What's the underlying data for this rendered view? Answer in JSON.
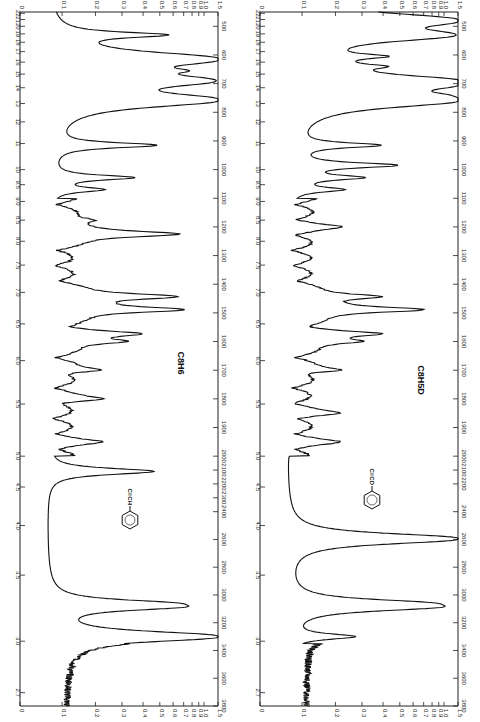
{
  "page": {
    "background": "#ffffff",
    "ink": "#111111"
  },
  "chart_data": [
    {
      "type": "line",
      "title": "C8H6",
      "structure_label": "C≡CH",
      "orientation": "rotated-90 (wavenumber vertical, absorbance horizontal)",
      "xlabel": "Wavenumber (cm-1)",
      "ylabel": "Absorbance",
      "wavenumber_range": [
        450,
        3800
      ],
      "absorbance_range": [
        0,
        1.5
      ],
      "wavenumber_ticks": [
        500,
        600,
        700,
        800,
        900,
        1000,
        1100,
        1200,
        1300,
        1400,
        1500,
        1600,
        1700,
        1800,
        1900,
        2000,
        2100,
        2200,
        2300,
        2400,
        2600,
        2800,
        3000,
        3200,
        3400,
        3600,
        3800
      ],
      "absorbance_ticks": [
        "0",
        "0.1",
        "0.2",
        "0.3",
        "0.4",
        "0.5",
        "0.6",
        "0.7",
        "0.8",
        "0.9",
        "1.0",
        "1.5"
      ],
      "micron_ticks": [
        "2.7",
        "3.0",
        "3.5",
        "4.0",
        "4.5",
        "5.0",
        "5.5",
        "6.0",
        "6.5",
        "7.0",
        "7.5",
        "8.0",
        "8.5",
        "9.0",
        "9.5",
        "10",
        "11",
        "12",
        "13",
        "14",
        "15",
        "16",
        "17",
        "18",
        "19",
        "20",
        "21",
        "22"
      ],
      "peaks": [
        {
          "wavenumber": 530,
          "absorbance": 0.45
        },
        {
          "wavenumber": 615,
          "absorbance": 1.5
        },
        {
          "wavenumber": 655,
          "absorbance": 0.35
        },
        {
          "wavenumber": 690,
          "absorbance": 1.2
        },
        {
          "wavenumber": 757,
          "absorbance": 1.5
        },
        {
          "wavenumber": 915,
          "absorbance": 0.4
        },
        {
          "wavenumber": 1028,
          "absorbance": 0.28
        },
        {
          "wavenumber": 1070,
          "absorbance": 0.15
        },
        {
          "wavenumber": 1176,
          "absorbance": 0.1
        },
        {
          "wavenumber": 1225,
          "absorbance": 0.58
        },
        {
          "wavenumber": 1443,
          "absorbance": 0.55
        },
        {
          "wavenumber": 1489,
          "absorbance": 0.6
        },
        {
          "wavenumber": 1573,
          "absorbance": 0.25
        },
        {
          "wavenumber": 1600,
          "absorbance": 0.22
        },
        {
          "wavenumber": 1700,
          "absorbance": 0.12
        },
        {
          "wavenumber": 1800,
          "absorbance": 0.12
        },
        {
          "wavenumber": 1950,
          "absorbance": 0.1
        },
        {
          "wavenumber": 2110,
          "absorbance": 0.4
        },
        {
          "wavenumber": 3060,
          "absorbance": 0.38
        },
        {
          "wavenumber": 3085,
          "absorbance": 0.5
        },
        {
          "wavenumber": 3300,
          "absorbance": 1.5
        }
      ]
    },
    {
      "type": "line",
      "title": "C8H5D",
      "structure_label": "C≡CD",
      "orientation": "rotated-90 (wavenumber vertical, absorbance horizontal)",
      "xlabel": "Wavenumber (cm-1)",
      "ylabel": "Absorbance",
      "wavenumber_range": [
        450,
        3800
      ],
      "absorbance_range": [
        0,
        1.5
      ],
      "wavenumber_ticks": [
        500,
        600,
        700,
        800,
        900,
        1000,
        1100,
        1200,
        1300,
        1400,
        1500,
        1600,
        1700,
        1800,
        1900,
        2000,
        2100,
        2200,
        2400,
        2600,
        2800,
        3000,
        3200,
        3400,
        3600,
        3800
      ],
      "absorbance_ticks": [
        "0",
        "0.1",
        "0.2",
        "0.3",
        "0.4",
        "0.5",
        "0.6",
        "0.7",
        "0.8",
        "0.9",
        "1.0",
        "1.5"
      ],
      "micron_ticks": [
        "2.7",
        "3.0",
        "3.5",
        "4.0",
        "4.5",
        "5.0",
        "5.5",
        "6.0",
        "6.5",
        "7.0",
        "7.5",
        "8.0",
        "8.5",
        "9.0",
        "9.5",
        "10",
        "11",
        "12",
        "13",
        "14",
        "15",
        "16",
        "17",
        "18",
        "19",
        "20",
        "21",
        "22"
      ],
      "peaks": [
        {
          "wavenumber": 480,
          "absorbance": 1.5
        },
        {
          "wavenumber": 530,
          "absorbance": 1.2
        },
        {
          "wavenumber": 605,
          "absorbance": 0.25
        },
        {
          "wavenumber": 640,
          "absorbance": 0.2
        },
        {
          "wavenumber": 690,
          "absorbance": 0.7
        },
        {
          "wavenumber": 700,
          "absorbance": 1.5
        },
        {
          "wavenumber": 757,
          "absorbance": 1.5
        },
        {
          "wavenumber": 740,
          "absorbance": 0.3
        },
        {
          "wavenumber": 915,
          "absorbance": 0.3
        },
        {
          "wavenumber": 985,
          "absorbance": 0.4
        },
        {
          "wavenumber": 1028,
          "absorbance": 0.22
        },
        {
          "wavenumber": 1070,
          "absorbance": 0.15
        },
        {
          "wavenumber": 1200,
          "absorbance": 0.1
        },
        {
          "wavenumber": 1443,
          "absorbance": 0.3
        },
        {
          "wavenumber": 1489,
          "absorbance": 0.6
        },
        {
          "wavenumber": 1573,
          "absorbance": 0.25
        },
        {
          "wavenumber": 1600,
          "absorbance": 0.2
        },
        {
          "wavenumber": 1700,
          "absorbance": 0.12
        },
        {
          "wavenumber": 1850,
          "absorbance": 0.1
        },
        {
          "wavenumber": 1950,
          "absorbance": 0.1
        },
        {
          "wavenumber": 2595,
          "absorbance": 1.5
        },
        {
          "wavenumber": 3060,
          "absorbance": 0.5
        },
        {
          "wavenumber": 3085,
          "absorbance": 0.72
        },
        {
          "wavenumber": 3300,
          "absorbance": 0.2
        }
      ]
    }
  ]
}
